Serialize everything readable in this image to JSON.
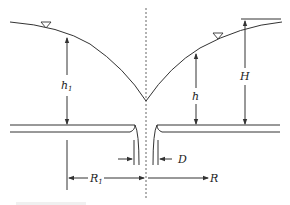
{
  "diagram": {
    "type": "well-drawdown-cross-section",
    "labels": {
      "h1_main": "h",
      "h1_sub": "1",
      "h": "h",
      "H": "H",
      "D": "D",
      "R1_main": "R",
      "R1_sub": "1",
      "R": "R"
    },
    "symbols": {
      "water_table_left": "triangle-down-icon",
      "water_table_right": "triangle-down-icon"
    },
    "caption_faded": "",
    "colors": {
      "line": "#333333",
      "dashed_axis": "#666666",
      "background": "#ffffff"
    }
  }
}
